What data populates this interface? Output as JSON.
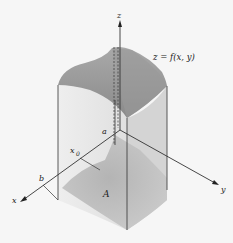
{
  "figure": {
    "surface_label": "z = f(x, y)",
    "axes": {
      "x": "x",
      "y": "y",
      "z": "z"
    },
    "points": {
      "a": "a",
      "b": "b",
      "x0": "x",
      "x0_sub": "0"
    },
    "region_label": "A"
  },
  "colors": {
    "background": "#f6f6f6",
    "surface_dark": "#8c8c8c",
    "surface_mid": "#a8a8a8",
    "surface_light": "#cfcfcf",
    "wall": "#dcdcdc",
    "line": "#333333"
  }
}
